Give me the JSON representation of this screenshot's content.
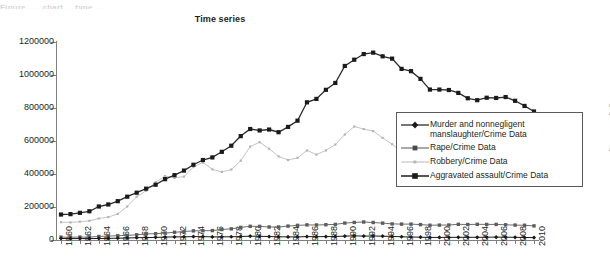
{
  "figure": {
    "caption_partial": "Figure  .   ... chart ...  type ...",
    "credit": "© Cengage Learning"
  },
  "chart_data": {
    "type": "line",
    "title": "Time series",
    "xlabel": "",
    "ylabel": "",
    "ylim": [
      0,
      1200000
    ],
    "yticks": [
      0,
      200000,
      400000,
      600000,
      800000,
      1000000,
      1200000
    ],
    "ytick_labels": [
      "0",
      "200000",
      "400000",
      "600000",
      "800000",
      "1000000",
      "1200000"
    ],
    "grid": false,
    "legend_position": "right",
    "x": [
      1960,
      1961,
      1962,
      1963,
      1964,
      1965,
      1966,
      1967,
      1968,
      1969,
      1970,
      1971,
      1972,
      1973,
      1974,
      1975,
      1976,
      1977,
      1978,
      1979,
      1980,
      1981,
      1982,
      1983,
      1984,
      1985,
      1986,
      1987,
      1988,
      1989,
      1990,
      1991,
      1992,
      1993,
      1994,
      1995,
      1996,
      1997,
      1998,
      1999,
      2000,
      2001,
      2002,
      2003,
      2004,
      2005,
      2006,
      2007,
      2008,
      2009,
      2010
    ],
    "xtick_labels": [
      "1960",
      "1962",
      "1964",
      "1966",
      "1968",
      "1970",
      "1972",
      "1974",
      "1976",
      "1978",
      "1980",
      "1982",
      "1984",
      "1986",
      "1988",
      "1990",
      "1992",
      "1994",
      "1996",
      "1998",
      "2000",
      "2002",
      "2004",
      "2006",
      "2008",
      "2010"
    ],
    "series": [
      {
        "name": "Murder and nonnegligent manslaughter/Crime Data",
        "color": "#1a1a1a",
        "marker": "diamond",
        "values": [
          9110,
          8740,
          8530,
          8640,
          9360,
          9960,
          11040,
          12240,
          13800,
          14760,
          16000,
          17780,
          18670,
          19640,
          20710,
          20510,
          18780,
          19120,
          19560,
          21460,
          23040,
          22520,
          21010,
          19308,
          18692,
          18976,
          20613,
          20096,
          20675,
          21500,
          23438,
          24703,
          23760,
          24526,
          23326,
          21606,
          19645,
          18208,
          16974,
          15522,
          15586,
          16037,
          16229,
          16528,
          16148,
          16740,
          17309,
          17128,
          16465,
          15399,
          14748
        ]
      },
      {
        "name": "Rape/Crime Data",
        "color": "#6e6e6e",
        "marker": "square",
        "values": [
          17190,
          17220,
          17550,
          17650,
          21420,
          23410,
          25820,
          27620,
          31670,
          37170,
          37990,
          42260,
          46850,
          51400,
          55400,
          56090,
          57080,
          63500,
          67610,
          76390,
          82990,
          82500,
          78770,
          78920,
          84230,
          88670,
          91460,
          91110,
          92486,
          94504,
          102555,
          106593,
          109062,
          106014,
          102216,
          97470,
          96252,
          96153,
          93144,
          89411,
          90178,
          90863,
          95235,
          93883,
          95089,
          94347,
          94472,
          92160,
          90479,
          89241,
          85593
        ]
      },
      {
        "name": "Robbery/Crime Data",
        "color": "#c4c4c4",
        "marker": "none",
        "values": [
          107840,
          106670,
          110860,
          116470,
          130390,
          138690,
          157990,
          202910,
          262840,
          298850,
          349860,
          387700,
          376290,
          384220,
          442400,
          470500,
          427810,
          412610,
          426930,
          480700,
          565840,
          592910,
          553130,
          506567,
          485008,
          497874,
          542775,
          517704,
          542968,
          578326,
          639271,
          687732,
          672478,
          659870,
          618949,
          580509,
          535594,
          498534,
          447186,
          409371,
          408016,
          423557,
          420806,
          414235,
          401470,
          417438,
          449246,
          447324,
          443574,
          408742,
          367832
        ]
      },
      {
        "name": "Aggravated assault/Crime Data",
        "color": "#2b2b2b",
        "marker": "square",
        "values": [
          154320,
          156760,
          164570,
          174210,
          203050,
          215330,
          235330,
          262600,
          286700,
          311090,
          334970,
          368760,
          393090,
          420650,
          456210,
          484710,
          500530,
          534350,
          571460,
          629480,
          672650,
          663900,
          669480,
          653294,
          685349,
          723246,
          834322,
          855088,
          910092,
          951707,
          1054863,
          1092739,
          1126974,
          1135607,
          1113179,
          1099207,
          1037049,
          1023201,
          976583,
          911740,
          911706,
          909023,
          891407,
          859030,
          847381,
          862220,
          860853,
          866358,
          843683,
          812514,
          778901
        ]
      }
    ]
  }
}
